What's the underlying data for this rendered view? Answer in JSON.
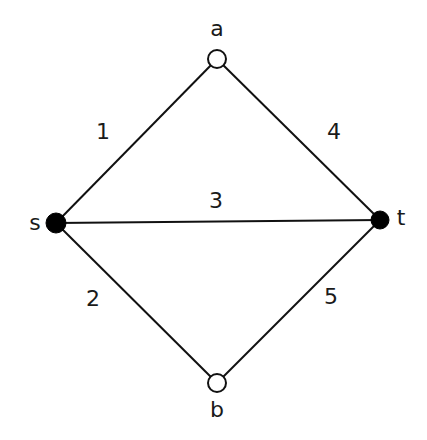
{
  "diagram": {
    "type": "weighted-graph",
    "nodes": [
      {
        "id": "a",
        "label": "a",
        "x": 217,
        "y": 59,
        "style": "open",
        "r": 9,
        "label_x": 217,
        "label_y": 28
      },
      {
        "id": "s",
        "label": "s",
        "x": 56,
        "y": 223,
        "style": "filled",
        "r": 10,
        "label_x": 35,
        "label_y": 222
      },
      {
        "id": "t",
        "label": "t",
        "x": 380,
        "y": 220,
        "style": "filled",
        "r": 9,
        "label_x": 401,
        "label_y": 217
      },
      {
        "id": "b",
        "label": "b",
        "x": 217,
        "y": 383,
        "style": "open",
        "r": 9,
        "label_x": 217,
        "label_y": 409
      }
    ],
    "edges": [
      {
        "from": "s",
        "to": "a",
        "weight": "1",
        "label_x": 103,
        "label_y": 131
      },
      {
        "from": "a",
        "to": "t",
        "weight": "4",
        "label_x": 334,
        "label_y": 131
      },
      {
        "from": "s",
        "to": "t",
        "weight": "3",
        "label_x": 216,
        "label_y": 200
      },
      {
        "from": "s",
        "to": "b",
        "weight": "2",
        "label_x": 93,
        "label_y": 298
      },
      {
        "from": "b",
        "to": "t",
        "weight": "5",
        "label_x": 331,
        "label_y": 296
      }
    ],
    "colors": {
      "edge": "#111111",
      "node_filled": "#000000",
      "node_open_fill": "#ffffff",
      "text": "#1a1a1a",
      "background": "#ffffff"
    }
  }
}
